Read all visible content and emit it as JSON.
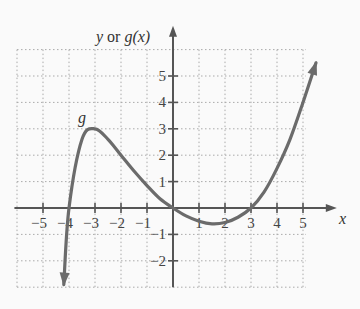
{
  "chart_data": {
    "type": "line",
    "title": "",
    "xlabel": "x",
    "ylabel": "y or g(x)",
    "ylabel_parts": {
      "y": "y",
      "or": " or ",
      "g": "g",
      "paren": "(x)"
    },
    "curve_label": "g",
    "xlim": [
      -6,
      5.5
    ],
    "ylim": [
      -3,
      6
    ],
    "x_ticks": [
      -5,
      -4,
      -3,
      -2,
      -1,
      1,
      2,
      3,
      4,
      5
    ],
    "x_tick_labels": [
      "−5",
      "−4",
      "−3",
      "−2",
      "−1",
      "1",
      "2",
      "3",
      "4",
      "5"
    ],
    "y_ticks": [
      5,
      4,
      3,
      2,
      1,
      -1,
      -2
    ],
    "y_tick_labels": [
      "5",
      "4",
      "3",
      "2",
      "1",
      "−1",
      "−2"
    ],
    "grid": true,
    "grid_style": "dotted",
    "series": [
      {
        "name": "g",
        "x": [
          -4.2,
          -4,
          -3.5,
          -3,
          -2.5,
          -2,
          -1.5,
          -1,
          -0.5,
          0,
          0.5,
          1,
          1.5,
          2,
          2.5,
          3,
          3.5,
          4,
          4.5,
          5,
          5.5
        ],
        "y": [
          -2.9,
          0,
          2.6,
          3,
          2.6,
          2,
          1.4,
          0.85,
          0.35,
          0,
          -0.3,
          -0.5,
          -0.6,
          -0.55,
          -0.35,
          0,
          0.6,
          1.5,
          2.6,
          4,
          5.5
        ],
        "arrows": "both ends",
        "color": "#6b6b6b"
      }
    ],
    "key_points": [
      {
        "x": -4,
        "y": 0,
        "note": "x-intercept"
      },
      {
        "x": -3,
        "y": 3,
        "note": "local maximum"
      },
      {
        "x": 0,
        "y": 0,
        "note": "intercept at origin"
      },
      {
        "x": 1.7,
        "y": -0.6,
        "note": "local minimum (approx)"
      },
      {
        "x": 3,
        "y": 0,
        "note": "x-intercept"
      }
    ]
  },
  "colors": {
    "axis": "#555555",
    "grid": "#aaaaaa",
    "curve": "#6b6b6b",
    "background": "#fafafa"
  }
}
